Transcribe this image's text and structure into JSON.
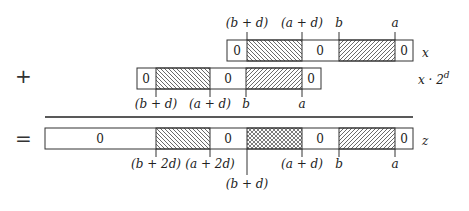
{
  "operators": {
    "plus": "+",
    "equals": "="
  },
  "rows": [
    {
      "name": "x",
      "label": "x",
      "zero_text": "0",
      "top_labels": [
        "(b + d)",
        "(a + d)",
        "b",
        "a"
      ]
    },
    {
      "name": "x_shifted",
      "label": "x · 2",
      "label_sup": "d",
      "zero_text": "0",
      "bottom_labels": [
        "(b + d)",
        "(a + d)",
        "b",
        "a"
      ]
    },
    {
      "name": "z",
      "label": "z",
      "zero_text": "0",
      "bottom_labels": [
        "(b + 2d)",
        "(a + 2d)",
        "(b + d)",
        "(a + d)",
        "b",
        "a"
      ]
    }
  ],
  "colors": {
    "stroke": "#333333",
    "hatch": "#444444"
  }
}
